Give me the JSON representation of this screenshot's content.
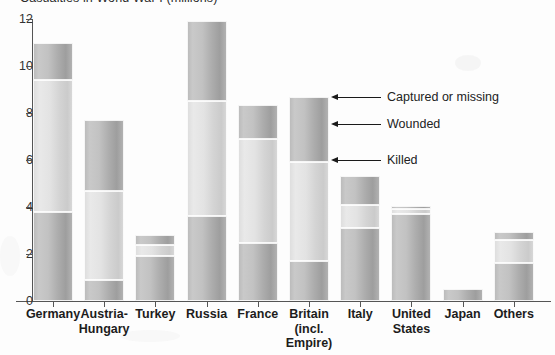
{
  "chart_data": {
    "type": "bar",
    "title": "Casualties in World War I (millions)",
    "xlabel": "",
    "ylabel": "",
    "ylim": [
      0,
      12
    ],
    "yticks": [
      0,
      2,
      4,
      6,
      8,
      10,
      12
    ],
    "grid": false,
    "stacked": true,
    "legend_position": "annotations",
    "categories": [
      "Germany",
      "Austria-Hungary",
      "Turkey",
      "Russia",
      "France",
      "Britain (incl. Empire)",
      "Italy",
      "United States",
      "Japan",
      "Others"
    ],
    "series": [
      {
        "name": "Killed",
        "values": [
          3.8,
          0.9,
          1.9,
          3.6,
          2.45,
          1.7,
          3.1,
          3.7,
          0.5,
          1.6
        ]
      },
      {
        "name": "Wounded",
        "values": [
          5.6,
          3.8,
          0.5,
          4.9,
          4.45,
          4.2,
          1.0,
          0.2,
          0.0,
          1.0
        ]
      },
      {
        "name": "Captured or missing",
        "values": [
          1.6,
          3.0,
          0.4,
          3.4,
          1.45,
          2.8,
          1.2,
          0.15,
          0.0,
          0.35
        ]
      }
    ],
    "totals": [
      11.0,
      7.7,
      2.8,
      11.9,
      8.35,
      8.7,
      5.35,
      4.05,
      0.5,
      2.95
    ],
    "annotations": [
      {
        "label": "Captured or missing",
        "points_to": "Britain (incl. Empire)"
      },
      {
        "label": "Wounded",
        "points_to": "Britain (incl. Empire)"
      },
      {
        "label": "Killed",
        "points_to": "Britain (incl. Empire)"
      }
    ]
  },
  "axis": {
    "y_tick_labels": [
      "12",
      "10",
      "8",
      "6",
      "4",
      "2",
      "0"
    ]
  },
  "categories_display": [
    {
      "line1": "Germany",
      "line2": "",
      "line3": ""
    },
    {
      "line1": "Austria-",
      "line2": "Hungary",
      "line3": ""
    },
    {
      "line1": "Turkey",
      "line2": "",
      "line3": ""
    },
    {
      "line1": "Russia",
      "line2": "",
      "line3": ""
    },
    {
      "line1": "France",
      "line2": "",
      "line3": ""
    },
    {
      "line1": "Britain",
      "line2": "(incl.",
      "line3": "Empire)"
    },
    {
      "line1": "Italy",
      "line2": "",
      "line3": ""
    },
    {
      "line1": "United",
      "line2": "States",
      "line3": ""
    },
    {
      "line1": "Japan",
      "line2": "",
      "line3": ""
    },
    {
      "line1": "Others",
      "line2": "",
      "line3": ""
    }
  ],
  "annotations_display": [
    {
      "label": "Captured or missing"
    },
    {
      "label": "Wounded"
    },
    {
      "label": "Killed"
    }
  ],
  "colors": {
    "bar_fill": "#bdbdbd",
    "bar_fill_light": "#e0e0e0",
    "axis": "#555555",
    "text": "#1c1c1c",
    "background": "#fdfdfd"
  }
}
